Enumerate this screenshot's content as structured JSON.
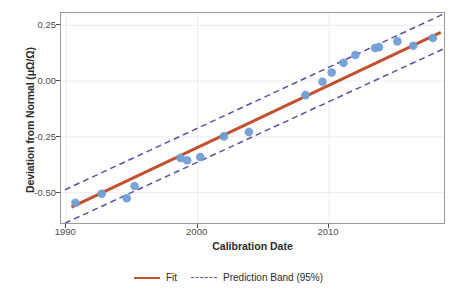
{
  "chart_data": {
    "type": "scatter",
    "title": "",
    "xlabel": "Calibration Date",
    "ylabel": "Deviation from Normal (μΩ/Ω)",
    "xlim": [
      1989.6,
      2018.9
    ],
    "ylim": [
      -0.645,
      0.305
    ],
    "xticks": [
      1990,
      2000,
      2010
    ],
    "xtick_labels": [
      "1990",
      "2000",
      "2010"
    ],
    "yticks": [
      0.25,
      0.0,
      -0.25,
      -0.5
    ],
    "ytick_labels": [
      "0.25",
      "0.00",
      "-0.25",
      "-0.50"
    ],
    "grid": true,
    "legend_position": "bottom",
    "points": {
      "name": "Calibration measurements",
      "marker": "circle",
      "color": "#6f9fd4",
      "x": [
        1990.7,
        1992.7,
        1994.6,
        1995.2,
        1998.7,
        1999.2,
        2000.2,
        2002.0,
        2003.9,
        2008.2,
        2009.5,
        2010.2,
        2011.1,
        2012.0,
        2013.5,
        2013.8,
        2015.2,
        2016.4,
        2017.9
      ],
      "y": [
        -0.545,
        -0.505,
        -0.525,
        -0.47,
        -0.345,
        -0.355,
        -0.34,
        -0.248,
        -0.228,
        -0.063,
        -0.003,
        0.038,
        0.082,
        0.117,
        0.148,
        0.152,
        0.178,
        0.158,
        0.193
      ]
    },
    "series": [
      {
        "name": "Fit",
        "type": "line",
        "style": "solid",
        "color": "#c4502f",
        "x": [
          1990.4,
          2018.5
        ],
        "y": [
          -0.565,
          0.218
        ]
      },
      {
        "name": "Prediction Band (95%) upper",
        "type": "line",
        "style": "dashed",
        "color": "#5b4fa8",
        "x": [
          1989.9,
          2018.7
        ],
        "y": [
          -0.487,
          0.3
        ]
      },
      {
        "name": "Prediction Band (95%) lower",
        "type": "line",
        "style": "dashed",
        "color": "#5b4fa8",
        "x": [
          1989.9,
          2018.7
        ],
        "y": [
          -0.637,
          0.144
        ]
      }
    ],
    "legend": [
      {
        "label": "Fit",
        "style": "solid",
        "color": "#c4502f"
      },
      {
        "label": "Prediction Band (95%)",
        "style": "dashed",
        "color": "#5b4fa8"
      }
    ]
  },
  "axes": {
    "y_title": "Deviation from Normal (μΩ/Ω)",
    "x_title": "Calibration Date",
    "y_tick_labels": [
      "0.25",
      "0.00",
      "-0.25",
      "-0.50"
    ],
    "x_tick_labels": [
      "1990",
      "2000",
      "2010"
    ]
  },
  "legend": {
    "fit_label": "Fit",
    "band_label": "Prediction Band (95%)"
  },
  "colors": {
    "point": "#6f9fd4",
    "fit": "#c4502f",
    "band": "#5b4fa8",
    "panel_border": "#9a9a9a",
    "grid": "#ececec",
    "text": "#2b2b2b"
  }
}
